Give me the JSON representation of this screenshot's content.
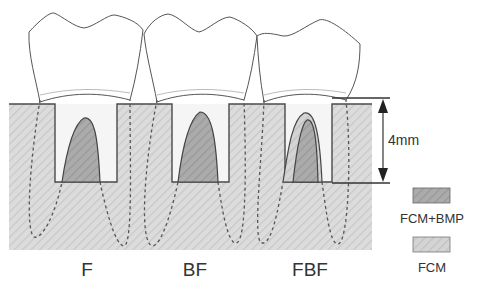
{
  "diagram": {
    "groups": [
      {
        "id": "F",
        "label": "F",
        "fill": "FCM+BMP",
        "layered": false
      },
      {
        "id": "BF",
        "label": "BF",
        "fill": "FCM+BMP",
        "layered": false
      },
      {
        "id": "FBF",
        "label": "FBF",
        "fill": "FCM+BMP",
        "outer_fill": "FCM",
        "layered": true
      }
    ],
    "dimension": {
      "label": "4mm"
    },
    "legend": [
      {
        "label": "FCM+BMP",
        "color": "#a8a8a8"
      },
      {
        "label": "FCM",
        "color": "#d6d6d6"
      }
    ],
    "colors": {
      "bone": "#d9d9d9",
      "bone_hatch": "#c6c6c6",
      "fcm_bmp": "#a9a9a9",
      "fcm": "#d2d2d2",
      "outline": "#555555",
      "tooth_fill": "#ffffff",
      "defect_fill": "#f7f7f7"
    }
  }
}
